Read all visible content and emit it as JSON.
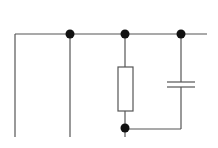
{
  "diagram": {
    "type": "circuit-schematic",
    "background": "#ffffff",
    "wire_color": "#555555",
    "node_color": "#111111",
    "components": [
      {
        "kind": "resistor",
        "label": ""
      },
      {
        "kind": "capacitor",
        "label": ""
      }
    ],
    "nodes": 4
  }
}
